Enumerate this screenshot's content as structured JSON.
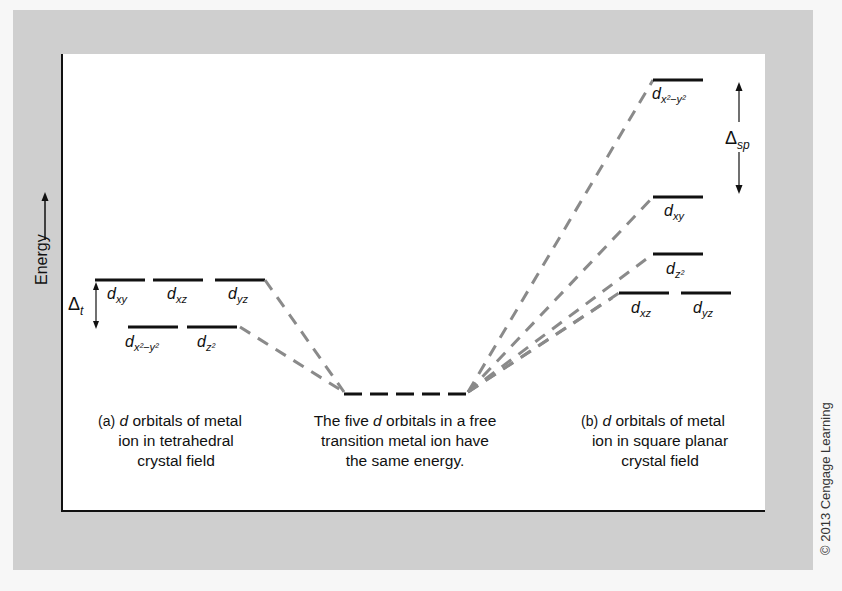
{
  "axis": {
    "label": "Energy",
    "arrow": "right-arrow"
  },
  "tetrahedral": {
    "upper_levels": [
      {
        "orbital": "d",
        "subscript": "xy"
      },
      {
        "orbital": "d",
        "subscript": "xz"
      },
      {
        "orbital": "d",
        "subscript": "yz"
      }
    ],
    "lower_levels": [
      {
        "orbital": "d",
        "subscript": "x²−y²"
      },
      {
        "orbital": "d",
        "subscript": "z²"
      }
    ],
    "splitting": {
      "symbol": "Δ",
      "subscript": "t"
    },
    "caption_prefix": "(a)",
    "caption_italic": "d",
    "caption_line1": " orbitals of metal",
    "caption_line2": "ion in tetrahedral",
    "caption_line3": "crystal field"
  },
  "free_ion": {
    "caption_line1_pre": "The five ",
    "caption_italic": "d",
    "caption_line1_post": " orbitals in a free",
    "caption_line2": "transition metal ion have",
    "caption_line3": "the same energy."
  },
  "square_planar": {
    "levels": [
      {
        "orbital": "d",
        "subscript": "x²−y²"
      },
      {
        "orbital": "d",
        "subscript": "xy"
      },
      {
        "orbital": "d",
        "subscript": "z²"
      },
      {
        "orbital": "d",
        "subscript": "xz"
      },
      {
        "orbital": "d",
        "subscript": "yz"
      }
    ],
    "splitting": {
      "symbol": "Δ",
      "subscript": "sp"
    },
    "caption_prefix": "(b)",
    "caption_italic": "d",
    "caption_line1": " orbitals of metal",
    "caption_line2": "ion in square planar",
    "caption_line3": "crystal field"
  },
  "copyright": "© 2013 Cengage Learning",
  "colors": {
    "frame": "#cfcfcf",
    "level": "#111111",
    "connector": "#8a8a8a"
  }
}
